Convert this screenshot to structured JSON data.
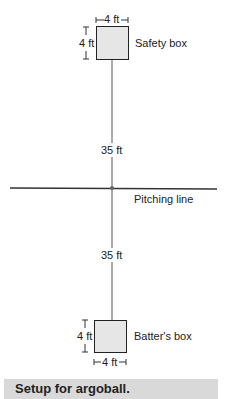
{
  "diagram": {
    "safety_box": {
      "label": "Safety box",
      "width_label": "4 ft",
      "height_label": "4 ft"
    },
    "batters_box": {
      "label": "Batter's box",
      "width_label": "4 ft",
      "height_label": "4 ft"
    },
    "upper_distance": "35 ft",
    "lower_distance": "35 ft",
    "pitching_line": "Pitching line"
  },
  "caption": "Setup for argoball.",
  "colors": {
    "line": "#222222",
    "box_fill": "#e6e6e6",
    "caption_bg": "#d9d9d9"
  }
}
